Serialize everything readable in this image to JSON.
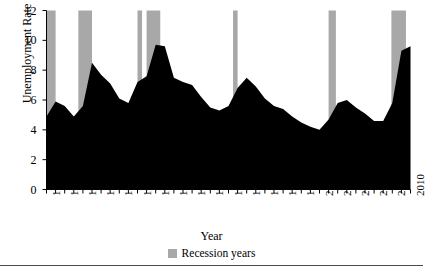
{
  "chart_data": {
    "type": "area",
    "title": "",
    "xlabel": "Year",
    "ylabel": "Unemployment Rate",
    "xlim": [
      1970,
      2010
    ],
    "ylim": [
      0,
      12
    ],
    "grid": false,
    "legend_position": "bottom-center",
    "y_ticks": [
      0,
      2,
      4,
      6,
      8,
      10,
      12
    ],
    "x_ticks": [
      1970,
      1972,
      1974,
      1976,
      1978,
      1980,
      1982,
      1984,
      1986,
      1988,
      1990,
      1992,
      1994,
      1996,
      1998,
      2000,
      2002,
      2004,
      2006,
      2008,
      2010
    ],
    "x_minor_tick_step": 1,
    "series": [
      {
        "name": "Unemployment Rate",
        "type": "area",
        "fill_color": "#000000",
        "x": [
          1970,
          1971,
          1972,
          1973,
          1974,
          1975,
          1976,
          1977,
          1978,
          1979,
          1980,
          1981,
          1982,
          1983,
          1984,
          1985,
          1986,
          1987,
          1988,
          1989,
          1990,
          1991,
          1992,
          1993,
          1994,
          1995,
          1996,
          1997,
          1998,
          1999,
          2000,
          2001,
          2002,
          2003,
          2004,
          2005,
          2006,
          2007,
          2008,
          2009,
          2010
        ],
        "values": [
          4.9,
          5.9,
          5.6,
          4.9,
          5.6,
          8.5,
          7.7,
          7.1,
          6.1,
          5.8,
          7.2,
          7.6,
          9.7,
          9.6,
          7.5,
          7.2,
          7.0,
          6.2,
          5.5,
          5.3,
          5.6,
          6.8,
          7.5,
          6.9,
          6.1,
          5.6,
          5.4,
          4.9,
          4.5,
          4.2,
          4.0,
          4.7,
          5.8,
          6.0,
          5.5,
          5.1,
          4.6,
          4.6,
          5.8,
          9.3,
          9.6
        ]
      },
      {
        "name": "Recession years",
        "type": "bar",
        "fill_color": "#a8a8a8",
        "spans": [
          {
            "start": 1970.0,
            "end": 1971.0
          },
          {
            "start": 1973.5,
            "end": 1975.0
          },
          {
            "start": 1980.0,
            "end": 1980.5
          },
          {
            "start": 1981.0,
            "end": 1982.5
          },
          {
            "start": 1990.5,
            "end": 1991.0
          },
          {
            "start": 2001.0,
            "end": 2001.8
          },
          {
            "start": 2007.9,
            "end": 2009.5
          }
        ]
      }
    ],
    "legend": [
      {
        "label": "Recession years",
        "color": "#a8a8a8"
      }
    ]
  },
  "axis": {
    "ylabel": "Unemployment Rate",
    "xlabel": "Year",
    "y_tick_labels": [
      "12",
      "10",
      "8",
      "6",
      "4",
      "2",
      "0"
    ],
    "x_tick_labels": [
      "1970",
      "1972",
      "1974",
      "1976",
      "1978",
      "1980",
      "1982",
      "1984",
      "1986",
      "1988",
      "1990",
      "1992",
      "1994",
      "1996",
      "1998",
      "2000",
      "2002",
      "2004",
      "2006",
      "2008",
      "2010"
    ]
  },
  "legend": {
    "recession_label": "Recession years",
    "recession_color": "#a8a8a8"
  },
  "colors": {
    "area": "#000000",
    "recession": "#a8a8a8",
    "axis": "#000000",
    "rule": "#4a4a4a"
  }
}
